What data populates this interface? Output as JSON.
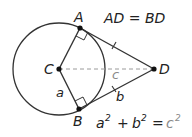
{
  "diagram": {
    "colors": {
      "stroke": "#333333",
      "dashed": "#9a9a9a",
      "label": "#222222",
      "hyp_label": "#8a8a8a",
      "background": "#ffffff"
    },
    "circle": {
      "center": "C",
      "cx": 59,
      "cy": 69,
      "r": 46
    },
    "points": [
      {
        "id": "A",
        "label": "A",
        "x": 80,
        "y": 28
      },
      {
        "id": "B",
        "label": "B",
        "x": 79,
        "y": 109
      },
      {
        "id": "C",
        "label": "C",
        "x": 59,
        "y": 69
      },
      {
        "id": "D",
        "label": "D",
        "x": 154,
        "y": 69
      }
    ],
    "segments": [
      {
        "from": "C",
        "to": "A",
        "style": "solid"
      },
      {
        "from": "C",
        "to": "B",
        "style": "solid"
      },
      {
        "from": "A",
        "to": "D",
        "style": "solid",
        "tick": true
      },
      {
        "from": "B",
        "to": "D",
        "style": "solid",
        "tick": true
      },
      {
        "from": "C",
        "to": "D",
        "style": "dashed"
      }
    ],
    "right_angles": [
      "A",
      "B"
    ],
    "segment_labels": {
      "CB": "a",
      "BD": "b",
      "CD": "c"
    },
    "equations": {
      "equal_tangents": "AD = BD",
      "pythagorean_base": "a",
      "pythagorean_plus": "+",
      "pythagorean_b": "b",
      "pythagorean_eq": "=",
      "pythagorean_c": "c",
      "exp": "2"
    }
  }
}
